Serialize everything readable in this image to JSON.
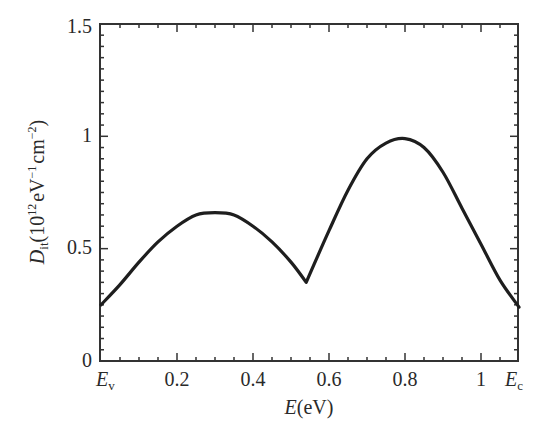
{
  "chart_data": {
    "type": "line",
    "title": "",
    "xlabel": "E(eV)",
    "ylabel": "D_it(10^12 eV^-1 cm^-2)",
    "xlim": [
      0,
      1.1
    ],
    "ylim": [
      0,
      1.5
    ],
    "x_tick_labels": [
      "E_v",
      "0.2",
      "0.4",
      "0.6",
      "0.8",
      "1",
      "E_c"
    ],
    "x_tick_values": [
      0,
      0.2,
      0.4,
      0.6,
      0.8,
      1.0,
      1.1
    ],
    "y_tick_labels": [
      "0",
      "0.5",
      "1",
      "1.5"
    ],
    "y_tick_values": [
      0,
      0.5,
      1.0,
      1.5
    ],
    "grid": false,
    "legend": null,
    "series": [
      {
        "name": "D_it",
        "x": [
          0.0,
          0.05,
          0.1,
          0.15,
          0.2,
          0.25,
          0.3,
          0.35,
          0.4,
          0.45,
          0.5,
          0.54,
          0.6,
          0.65,
          0.7,
          0.75,
          0.8,
          0.85,
          0.9,
          0.95,
          1.0,
          1.05,
          1.1
        ],
        "y": [
          0.25,
          0.34,
          0.44,
          0.53,
          0.6,
          0.65,
          0.66,
          0.65,
          0.6,
          0.53,
          0.44,
          0.35,
          0.58,
          0.76,
          0.9,
          0.97,
          0.99,
          0.95,
          0.84,
          0.68,
          0.52,
          0.36,
          0.24
        ]
      }
    ]
  },
  "labels": {
    "y_axis_main": "D",
    "y_axis_sub": "it",
    "y_axis_unit_open": "(10",
    "y_axis_exp1": "12",
    "y_axis_unit_mid": "eV",
    "y_axis_exp2": "−1",
    "y_axis_unit_cm": "cm",
    "y_axis_exp3": "−2",
    "y_axis_close": ")",
    "x_axis_italic": "E",
    "x_axis_unit": "(eV)",
    "ev_main": "E",
    "ev_sub": "v",
    "ec_main": "E",
    "ec_sub": "c",
    "x_ticks": [
      "0.2",
      "0.4",
      "0.6",
      "0.8",
      "1"
    ],
    "y_ticks": [
      "0",
      "0.5",
      "1",
      "1.5"
    ]
  }
}
